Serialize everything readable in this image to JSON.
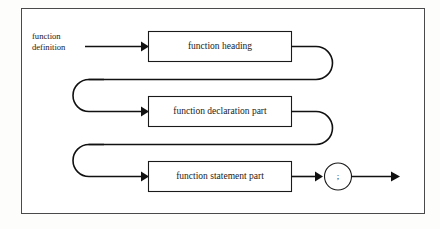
{
  "diagram": {
    "kind": "railroad-syntax-diagram",
    "title": "function definition",
    "frame": {
      "stroke_color": "#4a4a4a",
      "fill_color": "#ffffff"
    },
    "line_color": "#111111",
    "background_color": "#fdfdfb",
    "entry_label": {
      "line1": "function",
      "line2": "definition"
    },
    "nodes": [
      {
        "id": "function-heading",
        "label": "function heading",
        "shape": "rectangle"
      },
      {
        "id": "function-declaration-part",
        "label": "function declaration part",
        "shape": "rectangle"
      },
      {
        "id": "function-statement-part",
        "label": "function statement part",
        "shape": "rectangle"
      }
    ],
    "terminal": {
      "id": "semicolon-terminal",
      "label": ";",
      "shape": "circle"
    },
    "arrows": [
      {
        "id": "entry-arrow",
        "into": "function-heading"
      },
      {
        "id": "loop-arrow-1",
        "into": "function-declaration-part"
      },
      {
        "id": "loop-arrow-2",
        "into": "function-statement-part"
      },
      {
        "id": "terminal-arrow",
        "into": "semicolon-terminal"
      },
      {
        "id": "exit-arrow",
        "into": "exit"
      }
    ],
    "connectors": [
      {
        "id": "right-uturn-1",
        "from": "function-heading",
        "to": "function-declaration-part"
      },
      {
        "id": "right-uturn-2",
        "from": "function-declaration-part",
        "to": "function-statement-part"
      }
    ]
  }
}
